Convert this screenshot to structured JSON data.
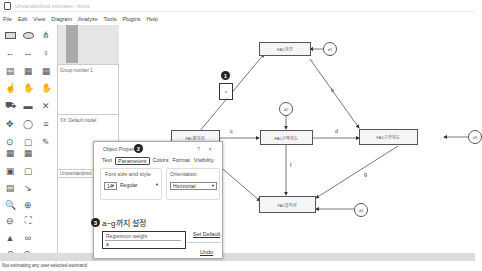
{
  "window": {
    "title": "Unstandardized estimates - Amos"
  },
  "menu": [
    "File",
    "Edit",
    "View",
    "Diagram",
    "Analyze",
    "Tools",
    "Plugins",
    "Help"
  ],
  "panel": {
    "group_label": "Group number 1",
    "model_label": "XX: Default model",
    "estimates_label": "Unstandardized estimates"
  },
  "status": {
    "text": "Not estimating any user-selected estimand"
  },
  "dialog": {
    "title": "Object Properties",
    "help": "?",
    "close": "✕",
    "tabs": [
      "Text",
      "Parameters",
      "Colors",
      "Format",
      "Visibility"
    ],
    "active_tab": "Parameters",
    "font_label": "Font size and style",
    "font_size": "14",
    "font_style": "Regular",
    "orientation_label": "Orientation",
    "orientation_value": "Horizontal",
    "field_label": "Regression weight",
    "field_value": "a",
    "set_default": "Set Default",
    "undo": "Undo"
  },
  "annotations": {
    "one": "1",
    "two": "2",
    "three": "3",
    "three_text": "a~g까지 설정"
  },
  "diagram": {
    "nodes": {
      "n1": "FAC의견",
      "n2": "FAC편의성",
      "n3": "FAC구매의도",
      "n4": "FAC구전의도",
      "n5": "FAC흥미성"
    },
    "errors": {
      "d1": "d1",
      "d2": "d2",
      "d3": "d3",
      "d4": "d4"
    },
    "selected_label": "a",
    "paths": {
      "b": "b",
      "c": "c",
      "d": "d",
      "e": "e",
      "f": "f",
      "g": "g"
    },
    "one_label": "1"
  }
}
